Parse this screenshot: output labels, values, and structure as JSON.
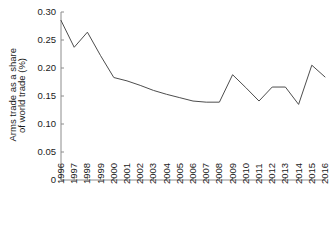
{
  "chart_data": {
    "type": "line",
    "title": "",
    "xlabel": "",
    "ylabel": "Arms trade as a share of world trade (%)",
    "ylabel_lines": [
      "Arms trade as a share",
      "of world trade (%)"
    ],
    "categories": [
      "1996",
      "1997",
      "1998",
      "1999",
      "2000",
      "2001",
      "2002",
      "2003",
      "2004",
      "2005",
      "2006",
      "2007",
      "2008",
      "2009",
      "2010",
      "2011",
      "2012",
      "2013",
      "2014",
      "2015",
      "2016"
    ],
    "values": [
      0.285,
      0.237,
      0.264,
      0.222,
      0.183,
      0.177,
      0.169,
      0.16,
      0.153,
      0.147,
      0.141,
      0.139,
      0.139,
      0.188,
      0.165,
      0.141,
      0.166,
      0.166,
      0.135,
      0.205,
      0.184
    ],
    "y_ticks": [
      0,
      0.05,
      0.1,
      0.15,
      0.2,
      0.25,
      0.3
    ],
    "y_tick_labels": [
      "0",
      "0.05",
      "0.10",
      "0.15",
      "0.20",
      "0.25",
      "0.30"
    ],
    "ylim": [
      0,
      0.3
    ],
    "grid": false,
    "legend": false,
    "series_color": "#4d4d4d",
    "axis_color": "#8c8c8c",
    "background": "#ffffff"
  }
}
